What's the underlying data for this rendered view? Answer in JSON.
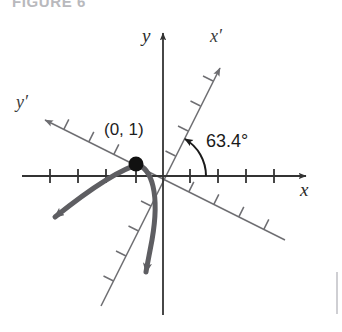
{
  "figure": {
    "caption": "FIGURE 6",
    "caption_color": "#b9b9bd"
  },
  "diagram": {
    "type": "rotated-coordinate-axes",
    "origin": {
      "x": 163,
      "y": 176
    },
    "axes": {
      "x": {
        "label": "x",
        "label_x": 306,
        "label_y": 196,
        "color": "#333333",
        "ticks": 8
      },
      "y": {
        "label": "y",
        "label_x": 142,
        "label_y": 42,
        "color": "#333333"
      },
      "x_prime": {
        "label": "x′",
        "label_x": 210,
        "label_y": 42,
        "color": "#6e6e72",
        "rotation_degrees": 63.4,
        "ticks": 7
      },
      "y_prime": {
        "label": "y′",
        "label_x": 16,
        "label_y": 108,
        "color": "#6e6e72",
        "rotation_degrees": 153.4,
        "ticks": 8
      }
    },
    "angle": {
      "value": "63.4°",
      "label_x": 206,
      "label_y": 147,
      "arc_color": "#1a1a1a",
      "from_axis": "x",
      "to_axis": "x′"
    },
    "point": {
      "label": "(0, 1)",
      "label_x": 104,
      "label_y": 135,
      "dot_x": 136,
      "dot_y": 164,
      "dot_radius": 7,
      "dot_color": "#111111"
    },
    "curve": {
      "name": "rotated-parabola",
      "color": "#5e5e62",
      "stroke_width": 5,
      "arrow_ends": 2
    }
  }
}
